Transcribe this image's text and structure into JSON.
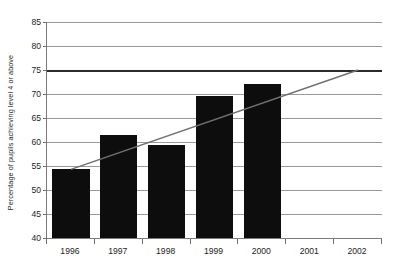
{
  "chart_data": {
    "type": "bar",
    "title": "",
    "subtitle": "",
    "xlabel": "",
    "ylabel": "Percentage of pupils achieving level 4 or above",
    "categories": [
      "1996",
      "1997",
      "1998",
      "1999",
      "2000",
      "2001",
      "2002"
    ],
    "values": [
      54.3,
      61.5,
      59.4,
      69.5,
      72.0,
      null,
      null
    ],
    "ylim": [
      40,
      85
    ],
    "y_ticks": [
      40,
      45,
      50,
      55,
      60,
      65,
      70,
      75,
      80,
      85
    ],
    "y_tick_labels": [
      "40",
      "45",
      "50",
      "55",
      "60",
      "65",
      "70",
      "75",
      "80",
      "85"
    ],
    "grid": true,
    "legend": "none",
    "bar_color": "#0d0d0d",
    "gridline_color": "#9a9a9a",
    "axis_color": "#7a7a7a",
    "series": [
      {
        "name": "Percentage of pupils achieving level 4 or above",
        "type": "bar",
        "categories": [
          "1996",
          "1997",
          "1998",
          "1999",
          "2000",
          "2001",
          "2002"
        ],
        "values": [
          54.3,
          61.5,
          59.4,
          69.5,
          72.0,
          null,
          null
        ]
      },
      {
        "name": "Trend line to target",
        "type": "line",
        "color": "#707070",
        "x": [
          "1996",
          "2002"
        ],
        "points": [
          {
            "x": "1996",
            "y": 54.3
          },
          {
            "x": "2002",
            "y": 75.0
          }
        ]
      }
    ],
    "annotations": [
      {
        "name": "target-line",
        "type": "horizontal-line",
        "value": 75,
        "label": "75",
        "color": "#2b2b2b",
        "emphasis": "bold"
      }
    ]
  }
}
